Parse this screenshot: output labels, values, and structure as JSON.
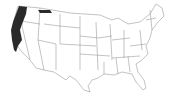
{
  "map": {
    "region": "Contiguous United States",
    "style": "state outline map",
    "base_fill": "#ffffff",
    "border_color": "#9a9a9a",
    "highlight_color": "#2a2a2a",
    "highlighted_range": [
      "western Washington",
      "western Oregon",
      "northern California coast",
      "northern Idaho panhandle strip"
    ]
  }
}
